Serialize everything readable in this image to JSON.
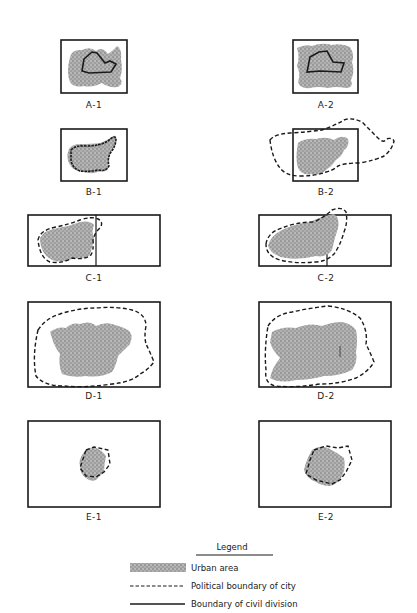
{
  "figure": {
    "panels": [
      {
        "id": "A-1",
        "label": "A-1"
      },
      {
        "id": "A-2",
        "label": "A-2"
      },
      {
        "id": "B-1",
        "label": "B-1"
      },
      {
        "id": "B-2",
        "label": "B-2"
      },
      {
        "id": "C-1",
        "label": "C-1"
      },
      {
        "id": "C-2",
        "label": "C-2"
      },
      {
        "id": "D-1",
        "label": "D-1"
      },
      {
        "id": "D-2",
        "label": "D-2"
      },
      {
        "id": "E-1",
        "label": "E-1"
      },
      {
        "id": "E-2",
        "label": "E-2"
      }
    ],
    "legend": {
      "title": "Legend",
      "items": [
        {
          "symbol": "stipple-fill",
          "label": "Urban area"
        },
        {
          "symbol": "dashed-line",
          "label": "Political boundary of city"
        },
        {
          "symbol": "solid-line",
          "label": "Boundary of civil division"
        }
      ]
    },
    "colors": {
      "ink": "#1a1a1a",
      "urban_fill": "#9a9a9a",
      "background": "#ffffff"
    }
  }
}
